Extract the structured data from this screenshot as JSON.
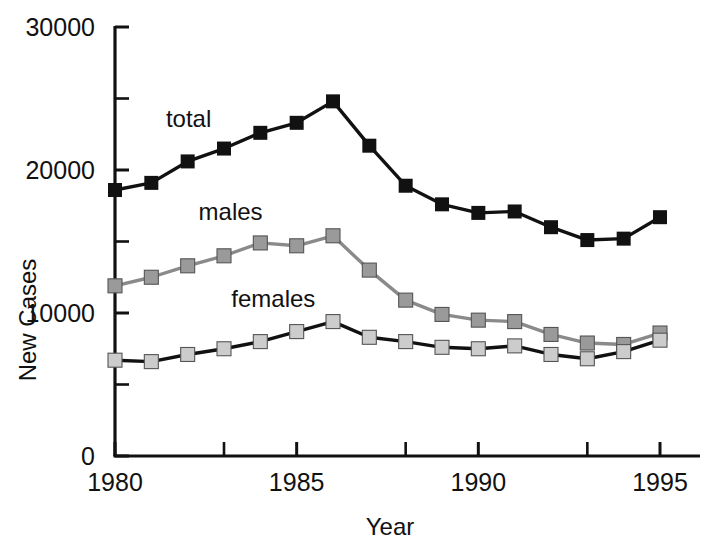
{
  "chart_data": {
    "type": "line",
    "title": "",
    "subtitle": "",
    "xlabel": "Year",
    "ylabel": "New Cases",
    "x": [
      1980,
      1981,
      1982,
      1983,
      1984,
      1985,
      1986,
      1987,
      1988,
      1989,
      1990,
      1991,
      1992,
      1993,
      1994,
      1995
    ],
    "xlim": [
      1980,
      1995
    ],
    "ylim": [
      0,
      30000
    ],
    "x_tick_values": [
      1980,
      1985,
      1990,
      1995
    ],
    "x_tick_labels": [
      "1980",
      "1985",
      "1990",
      "1995"
    ],
    "x_minor_ticks": [
      1983,
      1988,
      1993
    ],
    "y_tick_values": [
      0,
      10000,
      20000,
      30000
    ],
    "y_tick_labels": [
      "0",
      "10000",
      "20000",
      "30000"
    ],
    "y_minor_ticks": [
      5000,
      15000,
      25000
    ],
    "grid": false,
    "legend_position": "inline-annotations",
    "series": [
      {
        "name": "total",
        "label": "total",
        "line_color": "#111111",
        "marker_color": "#111111",
        "marker": "square",
        "values": [
          18600,
          19100,
          20600,
          21500,
          22600,
          23300,
          24800,
          21700,
          18900,
          17600,
          17000,
          17100,
          16000,
          15100,
          15200,
          16700
        ],
        "label_x": 1981.4,
        "label_y": 23000
      },
      {
        "name": "males",
        "label": "males",
        "line_color": "#8a8a8a",
        "marker_color": "#9a9a9a",
        "marker": "square",
        "values": [
          11900,
          12500,
          13300,
          14000,
          14900,
          14700,
          15400,
          13000,
          10900,
          9900,
          9500,
          9400,
          8500,
          7900,
          7800,
          8600
        ],
        "label_x": 1982.3,
        "label_y": 16500
      },
      {
        "name": "females",
        "label": "females",
        "line_color": "#111111",
        "marker_color": "#cccccc",
        "marker": "square",
        "values": [
          6700,
          6600,
          7100,
          7500,
          8000,
          8700,
          9400,
          8300,
          8000,
          7600,
          7500,
          7700,
          7100,
          6800,
          7300,
          8100
        ],
        "label_x": 1983.2,
        "label_y": 10400
      }
    ]
  },
  "axes": {
    "y_title": "New Cases",
    "x_title": "Year"
  }
}
